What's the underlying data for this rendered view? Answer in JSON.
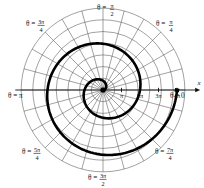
{
  "figure": {
    "center": {
      "x": 103,
      "y": 90
    },
    "axis_name_x": "x",
    "background": "#ffffff",
    "grid_color": "#555555",
    "axis_color": "#111111",
    "curve_color": "#000000"
  },
  "angle_labels": [
    {
      "id": "theta-0",
      "prefix": "θ =",
      "value": "0",
      "numerator": "",
      "denominator": "",
      "x": 170,
      "y": 98,
      "anchor": "start"
    },
    {
      "id": "theta-pi-4",
      "prefix": "θ =",
      "value": "",
      "numerator": "π",
      "denominator": "4",
      "x": 156,
      "y": 26,
      "anchor": "start"
    },
    {
      "id": "theta-pi-2",
      "prefix": "θ =",
      "value": "",
      "numerator": "π",
      "denominator": "2",
      "x": 97,
      "y": 10,
      "anchor": "start"
    },
    {
      "id": "theta-3pi-4",
      "prefix": "θ =",
      "value": "",
      "numerator": "3π",
      "denominator": "4",
      "x": 26,
      "y": 26,
      "anchor": "start"
    },
    {
      "id": "theta-pi",
      "prefix": "θ =",
      "value": "π",
      "numerator": "",
      "denominator": "",
      "x": 8,
      "y": 98,
      "anchor": "start"
    },
    {
      "id": "theta-5pi-4",
      "prefix": "θ =",
      "value": "",
      "numerator": "5π",
      "denominator": "4",
      "x": 22,
      "y": 154,
      "anchor": "start"
    },
    {
      "id": "theta-3pi-2",
      "prefix": "θ =",
      "value": "",
      "numerator": "3π",
      "denominator": "2",
      "x": 88,
      "y": 180,
      "anchor": "start"
    },
    {
      "id": "theta-7pi-4",
      "prefix": "θ =",
      "value": "",
      "numerator": "7π",
      "denominator": "4",
      "x": 155,
      "y": 154,
      "anchor": "start"
    }
  ],
  "radial_ticks": [
    {
      "label": "π",
      "r": 18.5
    },
    {
      "label": "2π",
      "r": 37
    },
    {
      "label": "3π",
      "r": 55.5
    },
    {
      "label": "4π",
      "r": 74
    }
  ],
  "chart_data": {
    "type": "line",
    "coordinate_system": "polar",
    "curve_equation": "r = θ",
    "theta_range": [
      0,
      12.566370614
    ],
    "theta_direction": "counterclockwise",
    "r_max": 12.566370614,
    "grid": {
      "circles_r": [
        1.5708,
        3.1416,
        4.7124,
        6.2832,
        7.854,
        9.4248,
        11.0,
        12.566
      ],
      "spoke_step_deg": 15,
      "spoke_count": 24
    },
    "axis_tick_labels": [
      "π",
      "2π",
      "3π",
      "4π"
    ],
    "axis_tick_values": [
      3.14159,
      6.28319,
      9.42478,
      12.56637
    ],
    "angle_tick_labels": [
      "θ = 0",
      "θ = π/4",
      "θ = π/2",
      "θ = 3π/4",
      "θ = π",
      "θ = 5π/4",
      "θ = 3π/2",
      "θ = 7π/4"
    ],
    "xlabel": "x",
    "ylabel": "",
    "legend": []
  }
}
